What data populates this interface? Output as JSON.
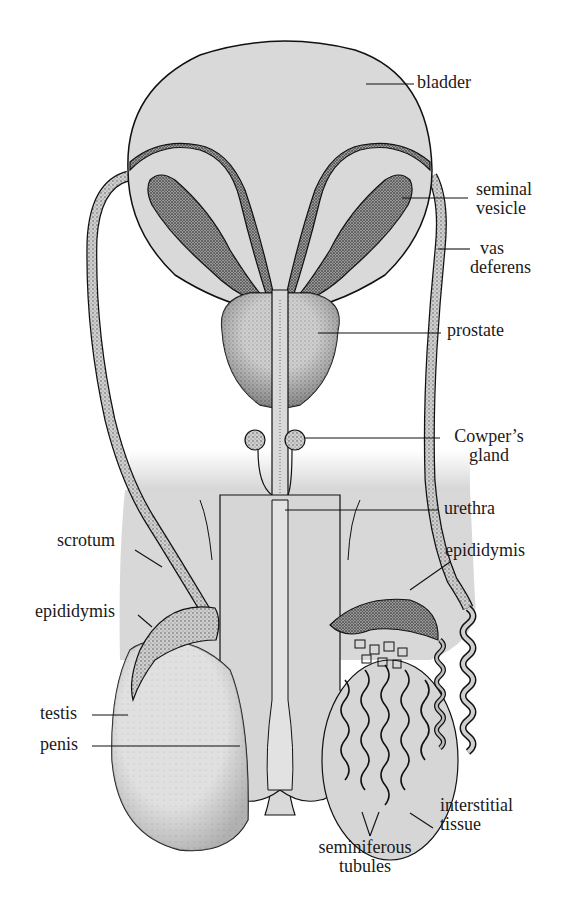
{
  "figure": {
    "colors": {
      "background": "#ffffff",
      "tissue_fill": "#d9d9d9",
      "tissue_fill_light": "#e2e2e2",
      "stipple_dark": "#3a3a3a",
      "outline": "#111111",
      "label_text": "#1a1a1a"
    },
    "labels": {
      "bladder": "bladder",
      "seminal_vesicle_line1": "seminal",
      "seminal_vesicle_line2": "vesicle",
      "vas_deferens_line1": "vas",
      "vas_deferens_line2": "deferens",
      "prostate": "prostate",
      "cowpers_gland_line1": "Cowper’s",
      "cowpers_gland_line2": "gland",
      "urethra": "urethra",
      "epididymis_right": "epididymis",
      "scrotum": "scrotum",
      "epididymis_left": "epididymis",
      "testis": "testis",
      "penis": "penis",
      "interstitial_tissue_line1": "interstitial",
      "interstitial_tissue_line2": "tissue",
      "seminiferous_tubules_line1": "seminiferous",
      "seminiferous_tubules_line2": "tubules"
    }
  }
}
